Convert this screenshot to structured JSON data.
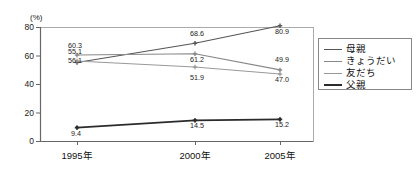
{
  "chart_data": {
    "type": "line",
    "title": "",
    "xlabel": "",
    "ylabel": "(%)",
    "unit_label": "(%)",
    "categories": [
      "1995年",
      "2000年",
      "2005年"
    ],
    "ylim": [
      0,
      80
    ],
    "yticks": [
      "0",
      "20",
      "40",
      "60",
      "80"
    ],
    "ytick_values": [
      0,
      20,
      40,
      60,
      80
    ],
    "grid": false,
    "legend_position": "right",
    "series": [
      {
        "name": "母親",
        "values": [
          55.1,
          68.6,
          80.9
        ],
        "labels": [
          "55.1",
          "68.6",
          "80.9"
        ],
        "color": "#555555",
        "width": 1.1
      },
      {
        "name": "きょうだい",
        "values": [
          60.3,
          61.2,
          49.9
        ],
        "labels": [
          "60.3",
          "61.2",
          "49.9"
        ],
        "color": "#888888",
        "width": 1.1
      },
      {
        "name": "友だち",
        "values": [
          56.1,
          51.9,
          47.0
        ],
        "labels": [
          "56.1",
          "51.9",
          "47.0"
        ],
        "color": "#999999",
        "width": 1.0
      },
      {
        "name": "父親",
        "values": [
          9.4,
          14.5,
          15.2
        ],
        "labels": [
          "9.4",
          "14.5",
          "15.2"
        ],
        "color": "#2b2b2b",
        "width": 1.6
      }
    ]
  },
  "legend": {
    "items": [
      {
        "label": "母親"
      },
      {
        "label": "きょうだい"
      },
      {
        "label": "友だち"
      },
      {
        "label": "父親"
      }
    ]
  },
  "style": {
    "plot_border": "#aaaaaa",
    "axis_color": "#555555",
    "background": "#ffffff"
  }
}
